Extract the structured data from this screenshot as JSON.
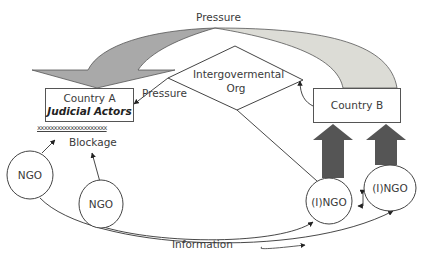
{
  "diagram": {
    "top_arrow_label": "Pressure",
    "country_a": {
      "line1": "Country A",
      "line2": "Judicial Actors"
    },
    "blockage_marker": "xxxxxxxxxxxxxxxxxxxxx",
    "blockage_label": "Blockage",
    "pressure_label": "Pressure",
    "igo": {
      "line1": "Intergovermental",
      "line2": "Org"
    },
    "country_b": {
      "label": "Country B"
    },
    "ngo_nodes": [
      {
        "label": "NGO"
      },
      {
        "label": "NGO"
      }
    ],
    "ingo_nodes": [
      {
        "label": "(I)NGO"
      },
      {
        "label": "(I)NGO"
      }
    ],
    "information_label": "Information",
    "colors": {
      "arrow_dark": "#a9a9a9",
      "arrow_light": "#dcdcd6",
      "block_arrow": "#555555",
      "stroke": "#444444"
    }
  }
}
